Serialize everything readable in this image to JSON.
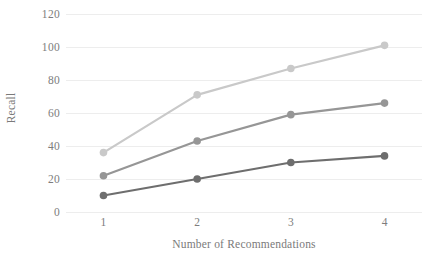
{
  "chart_data": {
    "type": "line",
    "title": "",
    "xlabel": "Number of Recommendations",
    "ylabel": "Recall",
    "categories": [
      "1",
      "2",
      "3",
      "4"
    ],
    "x": [
      1,
      2,
      3,
      4
    ],
    "xlim": [
      0.6,
      4.4
    ],
    "ylim": [
      0,
      120
    ],
    "y_ticks": [
      0,
      20,
      40,
      60,
      80,
      100,
      120
    ],
    "y_tick_labels": [
      "0",
      "20",
      "40",
      "60",
      "80",
      "100",
      "120"
    ],
    "x_tick_labels": [
      "1",
      "2",
      "3",
      "4"
    ],
    "grid": "horizontal",
    "legend": "none",
    "marker": "circle",
    "series": [
      {
        "name": "series-light",
        "color": "#c9c9c9",
        "values": [
          36,
          71,
          87,
          101
        ]
      },
      {
        "name": "series-medium",
        "color": "#969696",
        "values": [
          22,
          43,
          59,
          66
        ]
      },
      {
        "name": "series-dark",
        "color": "#6e6e6e",
        "values": [
          10,
          20,
          30,
          34
        ]
      }
    ]
  },
  "axes": {
    "y_title": "Recall",
    "x_title": "Number of Recommendations"
  },
  "colors": {
    "gridline": "#ededed",
    "text": "#7d7d7d",
    "background": "#ffffff"
  }
}
